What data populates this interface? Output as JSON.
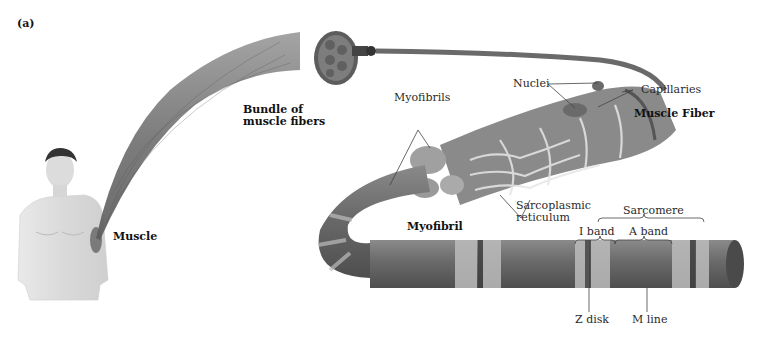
{
  "panel_label": "(a)",
  "labels": {
    "muscle": "Muscle",
    "bundle_line1": "Bundle of",
    "bundle_line2": "muscle fibers",
    "myofibrils": "Myofibrils",
    "nuclei": "Nuclei",
    "capillaries": "Capillaries",
    "muscle_fiber": "Muscle Fiber",
    "sarcoplasmic_line1": "Sarcoplasmic",
    "sarcoplasmic_line2": "reticulum",
    "myofibril": "Myofibril",
    "sarcomere": "Sarcomere",
    "i_band": "I band",
    "a_band": "A band",
    "z_disk": "Z disk",
    "m_line": "M line"
  }
}
